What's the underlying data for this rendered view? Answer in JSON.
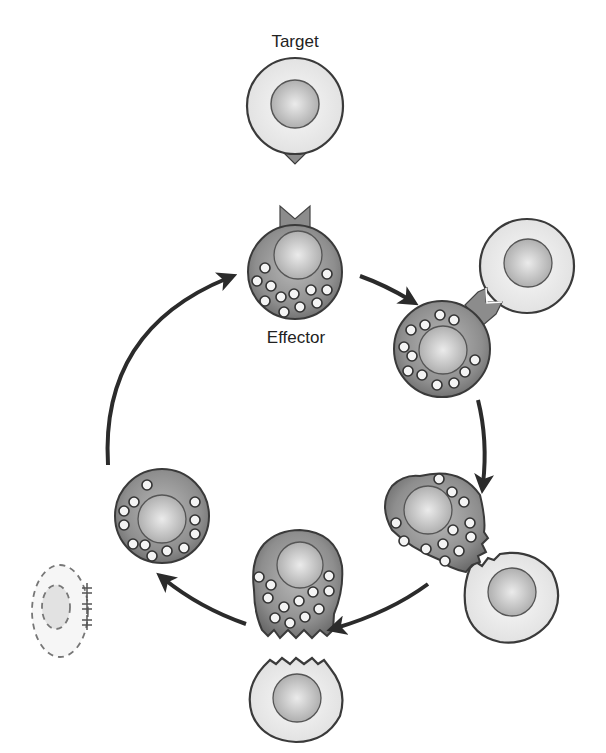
{
  "labels": {
    "target": "Target",
    "effector": "Effector"
  },
  "colors": {
    "effector_fill": "#8a8a8a",
    "effector_fill_light": "#b5b5b5",
    "target_fill": "#ececec",
    "nucleus_fill": "#c6c6c6",
    "nucleus_light": "#e6e6e6",
    "outline": "#3a3a3a",
    "arrow": "#2b2b2b",
    "granule_fill": "#f4f4f4",
    "dashed": "#777777"
  },
  "stages": [
    {
      "id": "target-cell-free",
      "description": "Target cell with antigen"
    },
    {
      "id": "effector-resting",
      "description": "Effector cell with receptor and granules"
    },
    {
      "id": "recognition",
      "description": "Effector binds target via receptor"
    },
    {
      "id": "granule-polarization",
      "description": "Granules polarize toward synapse"
    },
    {
      "id": "degranulation",
      "description": "Granule release into target"
    },
    {
      "id": "effector-recovery",
      "description": "Effector detaches; granules redistribute"
    },
    {
      "id": "target-apoptosis",
      "description": "Dying target cell (dashed outline)"
    }
  ]
}
